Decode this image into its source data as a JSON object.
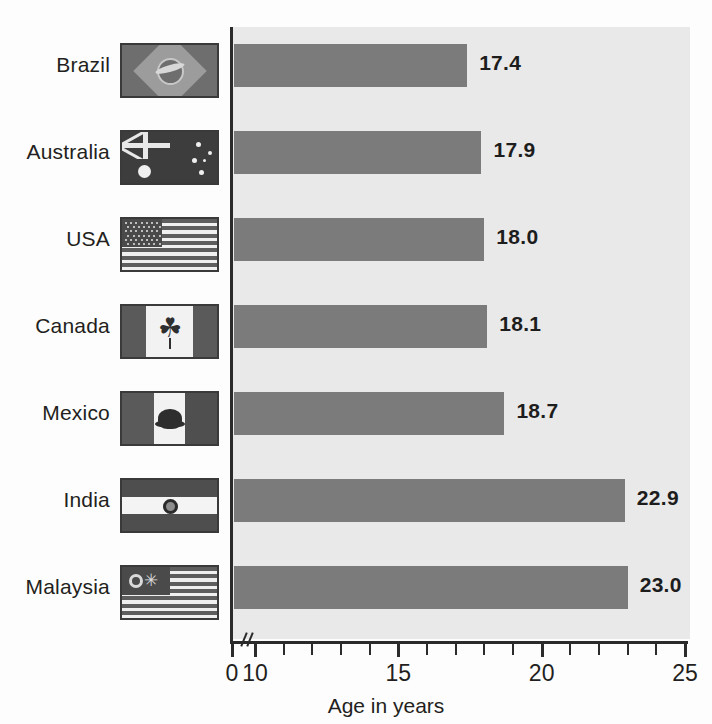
{
  "chart_data": {
    "type": "bar",
    "orientation": "horizontal",
    "title": "",
    "xlabel": "Age in years",
    "ylabel": "",
    "categories": [
      "Brazil",
      "Australia",
      "USA",
      "Canada",
      "Mexico",
      "India",
      "Malaysia"
    ],
    "values": [
      17.4,
      17.9,
      18.0,
      18.1,
      18.7,
      22.9,
      23.0
    ],
    "value_labels": [
      "17.4",
      "17.9",
      "18.0",
      "18.1",
      "18.7",
      "22.9",
      "23.0"
    ],
    "xlim": [
      10,
      25
    ],
    "axis_break": true,
    "axis_break_note": "axis broken between 0 and 10",
    "xticks_major": [
      0,
      10,
      15,
      20,
      25
    ],
    "xtick_labels": [
      "0",
      "10",
      "15",
      "20",
      "25"
    ],
    "xticks_minor": [
      11,
      12,
      13,
      14,
      16,
      17,
      18,
      19,
      21,
      22,
      23,
      24
    ],
    "grid": false,
    "legend": "none",
    "bar_color": "#7b7b7b",
    "plot_background": "#e9e9e9",
    "axis_color": "#2b2b2b",
    "text_color": "#231f20",
    "flags": [
      {
        "country": "Brazil",
        "icon": "flag-brazil-icon"
      },
      {
        "country": "Australia",
        "icon": "flag-australia-icon"
      },
      {
        "country": "USA",
        "icon": "flag-usa-icon"
      },
      {
        "country": "Canada",
        "icon": "flag-canada-icon"
      },
      {
        "country": "Mexico",
        "icon": "flag-mexico-icon"
      },
      {
        "country": "India",
        "icon": "flag-india-icon"
      },
      {
        "country": "Malaysia",
        "icon": "flag-malaysia-icon"
      }
    ]
  },
  "glyphs": {
    "maple_leaf": "☘",
    "star": "✳"
  }
}
